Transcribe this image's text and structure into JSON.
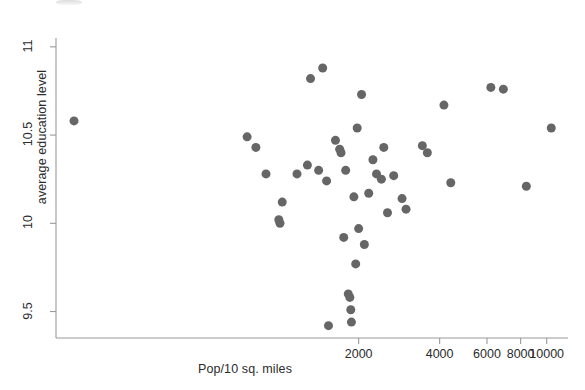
{
  "chart_data": {
    "type": "scatter",
    "title": "",
    "xlabel": "Pop/10 sq. miles",
    "ylabel": "average education level",
    "xscale": "log",
    "yscale": "linear",
    "xlim": [
      150,
      12000
    ],
    "ylim": [
      9.35,
      11.05
    ],
    "grid": false,
    "legend": null,
    "marker": {
      "shape": "circle",
      "color": "#666666",
      "size": 9
    },
    "xticks": [
      {
        "value": 2000,
        "label": "2000"
      },
      {
        "value": 4000,
        "label": "4000"
      },
      {
        "value": 6000,
        "label": "6000"
      },
      {
        "value": 8000,
        "label": "8000"
      },
      {
        "value": 10000,
        "label": "10000"
      }
    ],
    "yticks": [
      {
        "value": 9.5,
        "label": "9.5"
      },
      {
        "value": 10.0,
        "label": "10"
      },
      {
        "value": 10.5,
        "label": "10.5"
      },
      {
        "value": 11.0,
        "label": "11"
      }
    ],
    "points": [
      {
        "x": 175,
        "y": 10.58
      },
      {
        "x": 770,
        "y": 10.49
      },
      {
        "x": 830,
        "y": 10.43
      },
      {
        "x": 905,
        "y": 10.28
      },
      {
        "x": 1010,
        "y": 10.02
      },
      {
        "x": 1020,
        "y": 10.0
      },
      {
        "x": 1040,
        "y": 10.12
      },
      {
        "x": 1180,
        "y": 10.28
      },
      {
        "x": 1290,
        "y": 10.33
      },
      {
        "x": 1325,
        "y": 10.82
      },
      {
        "x": 1420,
        "y": 10.3
      },
      {
        "x": 1470,
        "y": 10.88
      },
      {
        "x": 1520,
        "y": 10.24
      },
      {
        "x": 1545,
        "y": 9.42
      },
      {
        "x": 1640,
        "y": 10.47
      },
      {
        "x": 1700,
        "y": 10.42
      },
      {
        "x": 1720,
        "y": 10.4
      },
      {
        "x": 1760,
        "y": 9.92
      },
      {
        "x": 1790,
        "y": 10.3
      },
      {
        "x": 1830,
        "y": 9.6
      },
      {
        "x": 1855,
        "y": 9.58
      },
      {
        "x": 1870,
        "y": 9.51
      },
      {
        "x": 1880,
        "y": 9.44
      },
      {
        "x": 1920,
        "y": 10.15
      },
      {
        "x": 1950,
        "y": 9.77
      },
      {
        "x": 1975,
        "y": 10.54
      },
      {
        "x": 2000,
        "y": 9.97
      },
      {
        "x": 2050,
        "y": 10.73
      },
      {
        "x": 2100,
        "y": 9.88
      },
      {
        "x": 2180,
        "y": 10.17
      },
      {
        "x": 2260,
        "y": 10.36
      },
      {
        "x": 2330,
        "y": 10.28
      },
      {
        "x": 2430,
        "y": 10.25
      },
      {
        "x": 2480,
        "y": 10.43
      },
      {
        "x": 2560,
        "y": 10.06
      },
      {
        "x": 2700,
        "y": 10.27
      },
      {
        "x": 2900,
        "y": 10.14
      },
      {
        "x": 3000,
        "y": 10.08
      },
      {
        "x": 3450,
        "y": 10.44
      },
      {
        "x": 3600,
        "y": 10.4
      },
      {
        "x": 4150,
        "y": 10.67
      },
      {
        "x": 4400,
        "y": 10.23
      },
      {
        "x": 6200,
        "y": 10.77
      },
      {
        "x": 6900,
        "y": 10.76
      },
      {
        "x": 8400,
        "y": 10.21
      },
      {
        "x": 10400,
        "y": 10.54
      }
    ]
  },
  "geometry": {
    "plot_left": 56,
    "plot_right": 568,
    "plot_top": 38,
    "plot_bottom": 338
  }
}
